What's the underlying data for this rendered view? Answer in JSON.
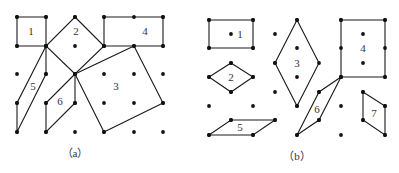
{
  "figures": [
    {
      "id": "a",
      "caption": "（a）",
      "caption_pos": [
        75,
        157
      ],
      "dots": [
        [
          17,
          17
        ],
        [
          46,
          17
        ],
        [
          75,
          17
        ],
        [
          104,
          17
        ],
        [
          134,
          17
        ],
        [
          163,
          17
        ],
        [
          17,
          46
        ],
        [
          46,
          46
        ],
        [
          75,
          46
        ],
        [
          104,
          46
        ],
        [
          134,
          46
        ],
        [
          163,
          46
        ],
        [
          17,
          74
        ],
        [
          46,
          74
        ],
        [
          75,
          74
        ],
        [
          104,
          74
        ],
        [
          134,
          74
        ],
        [
          163,
          74
        ],
        [
          17,
          103
        ],
        [
          46,
          103
        ],
        [
          75,
          103
        ],
        [
          104,
          103
        ],
        [
          134,
          103
        ],
        [
          163,
          103
        ],
        [
          17,
          132
        ],
        [
          46,
          132
        ],
        [
          75,
          132
        ],
        [
          104,
          132
        ],
        [
          134,
          132
        ],
        [
          163,
          132
        ]
      ],
      "shapes": [
        {
          "label": "1",
          "points": [
            [
              17,
              17
            ],
            [
              46,
              17
            ],
            [
              46,
              46
            ],
            [
              17,
              46
            ]
          ],
          "label_pos": [
            31,
            35
          ]
        },
        {
          "label": "2",
          "points": [
            [
              75,
              17
            ],
            [
              104,
              46
            ],
            [
              75,
              74
            ],
            [
              46,
              46
            ]
          ],
          "label_pos": [
            76,
            35
          ]
        },
        {
          "label": "3",
          "points": [
            [
              134,
              46
            ],
            [
              163,
              103
            ],
            [
              104,
              132
            ],
            [
              75,
              74
            ]
          ],
          "label_pos": [
            116,
            90
          ]
        },
        {
          "label": "4",
          "points": [
            [
              104,
              17
            ],
            [
              163,
              17
            ],
            [
              163,
              46
            ],
            [
              104,
              46
            ]
          ],
          "label_pos": [
            145,
            35
          ]
        },
        {
          "label": "5",
          "points": [
            [
              46,
              46
            ],
            [
              17,
              103
            ],
            [
              17,
              132
            ],
            [
              46,
              74
            ]
          ],
          "label_pos": [
            33,
            90
          ]
        },
        {
          "label": "6",
          "points": [
            [
              75,
              74
            ],
            [
              46,
              103
            ],
            [
              46,
              132
            ],
            [
              75,
              103
            ]
          ],
          "label_pos": [
            60,
            105
          ]
        }
      ]
    },
    {
      "id": "b",
      "caption": "（b）",
      "caption_pos": [
        297,
        160
      ],
      "dots": [
        [
          209,
          20
        ],
        [
          253,
          20
        ],
        [
          297,
          20
        ],
        [
          341,
          20
        ],
        [
          385,
          20
        ],
        [
          231,
          34
        ],
        [
          275,
          34
        ],
        [
          363,
          34
        ],
        [
          209,
          48
        ],
        [
          253,
          48
        ],
        [
          297,
          48
        ],
        [
          341,
          48
        ],
        [
          385,
          48
        ],
        [
          231,
          63
        ],
        [
          275,
          63
        ],
        [
          363,
          63
        ],
        [
          209,
          77
        ],
        [
          253,
          77
        ],
        [
          297,
          77
        ],
        [
          341,
          77
        ],
        [
          385,
          77
        ],
        [
          231,
          92
        ],
        [
          275,
          92
        ],
        [
          319,
          92
        ],
        [
          363,
          92
        ],
        [
          209,
          106
        ],
        [
          253,
          106
        ],
        [
          297,
          106
        ],
        [
          341,
          106
        ],
        [
          385,
          106
        ],
        [
          231,
          120
        ],
        [
          275,
          120
        ],
        [
          319,
          120
        ],
        [
          363,
          120
        ],
        [
          209,
          135
        ],
        [
          253,
          135
        ],
        [
          297,
          135
        ],
        [
          341,
          135
        ],
        [
          385,
          135
        ]
      ],
      "shapes": [
        {
          "label": "1",
          "points": [
            [
              209,
              20
            ],
            [
              253,
              20
            ],
            [
              253,
              48
            ],
            [
              209,
              48
            ]
          ],
          "label_pos": [
            240,
            38
          ]
        },
        {
          "label": "2",
          "points": [
            [
              231,
              63
            ],
            [
              253,
              77
            ],
            [
              231,
              92
            ],
            [
              209,
              77
            ]
          ],
          "label_pos": [
            231,
            81
          ]
        },
        {
          "label": "3",
          "points": [
            [
              297,
              20
            ],
            [
              319,
              63
            ],
            [
              297,
              106
            ],
            [
              275,
              63
            ]
          ],
          "label_pos": [
            297,
            67
          ]
        },
        {
          "label": "4",
          "points": [
            [
              341,
              20
            ],
            [
              385,
              20
            ],
            [
              385,
              77
            ],
            [
              341,
              77
            ]
          ],
          "label_pos": [
            363,
            52
          ]
        },
        {
          "label": "5",
          "points": [
            [
              231,
              120
            ],
            [
              275,
              120
            ],
            [
              253,
              135
            ],
            [
              209,
              135
            ]
          ],
          "label_pos": [
            240,
            131
          ]
        },
        {
          "label": "6",
          "points": [
            [
              341,
              77
            ],
            [
              319,
              92
            ],
            [
              297,
              135
            ],
            [
              319,
              120
            ]
          ],
          "label_pos": [
            317,
            113
          ]
        },
        {
          "label": "7",
          "points": [
            [
              363,
              92
            ],
            [
              385,
              106
            ],
            [
              385,
              135
            ],
            [
              363,
              120
            ]
          ],
          "label_pos": [
            374,
            117
          ]
        }
      ]
    }
  ]
}
